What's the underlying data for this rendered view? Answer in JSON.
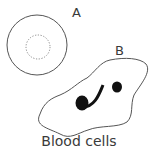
{
  "diagram": {
    "title": "Blood cells",
    "labels": [
      {
        "id": "A",
        "text": "A",
        "description": "Round cell with dotted inner ring (red blood cell)"
      },
      {
        "id": "B",
        "text": "B",
        "description": "Irregular cell with dark dumbbell-shaped nucleus (white blood cell)"
      }
    ],
    "colors": {
      "outline": "#555555",
      "nucleus": "#111111",
      "text": "#3a3a3a",
      "background": "#ffffff"
    }
  }
}
